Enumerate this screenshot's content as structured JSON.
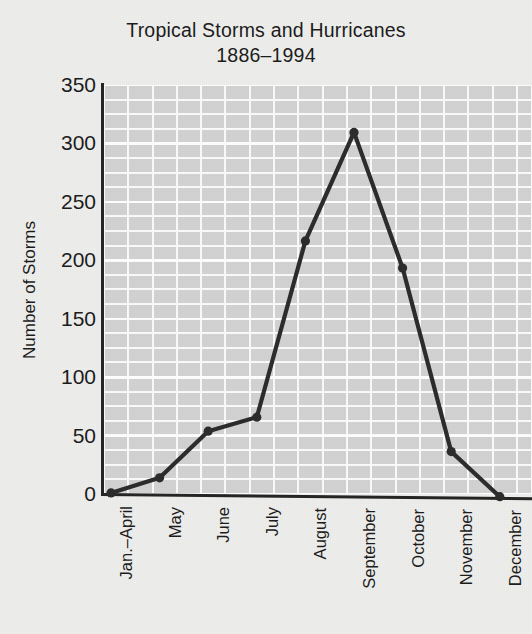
{
  "chart_data": {
    "type": "line",
    "title": "Tropical Storms and Hurricanes",
    "subtitle": "1886–1994",
    "title_line1": "Tropical Storms and Hurricanes",
    "title_line2": "1886–1994",
    "xlabel": "",
    "ylabel": "Number of Storms",
    "categories": [
      "Jan.–April",
      "May",
      "June",
      "July",
      "August",
      "September",
      "October",
      "November",
      "December"
    ],
    "values": [
      1,
      14,
      54,
      66,
      217,
      310,
      194,
      37,
      1
    ],
    "series": [
      {
        "name": "Number of Storms",
        "values": [
          1,
          14,
          54,
          66,
          217,
          310,
          194,
          37,
          1
        ]
      }
    ],
    "ylim": [
      0,
      350
    ],
    "yticks": [
      0,
      50,
      100,
      150,
      200,
      250,
      300,
      350
    ],
    "ytick_labels": [
      "0",
      "50",
      "100",
      "150",
      "200",
      "250",
      "300",
      "350"
    ],
    "grid": true,
    "grid_style": "minor and major horizontal white gridlines on gray panel",
    "legend": "none",
    "marker": "circle",
    "line_color": "#2b2b2b",
    "marker_color": "#2b2b2b",
    "panel_color": "#d2d2d2",
    "gridline_color": "#ffffff",
    "background_color": "#eeeeec",
    "text_color": "#1a1a1a"
  },
  "figure": {
    "title_line1": "Tropical Storms and Hurricanes",
    "title_line2": "1886–1994",
    "y_axis_title": "Number of Storms"
  }
}
